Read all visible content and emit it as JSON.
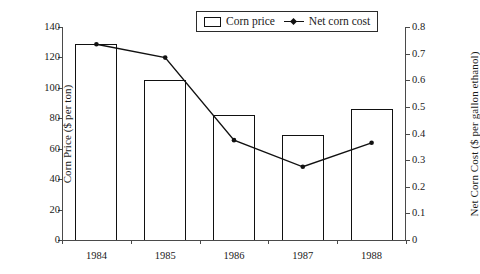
{
  "legend": {
    "entries": [
      {
        "label": "Corn price",
        "marker": "bar-swatch-icon"
      },
      {
        "label": "Net corn cost",
        "marker": "line-marker-icon"
      }
    ]
  },
  "axes": {
    "left_title": "Corn Price ($ per ton)",
    "right_title": "Net Corn Cost ($ per gallon ethanol)",
    "left_ticks": [
      "0",
      "20",
      "40",
      "60",
      "80",
      "100",
      "120",
      "140"
    ],
    "right_ticks": [
      "0",
      "0.1",
      "0.2",
      "0.3",
      "0.4",
      "0.5",
      "0.6",
      "0.7",
      "0.8"
    ],
    "x_ticks": [
      "1984",
      "1985",
      "1986",
      "1987",
      "1988"
    ]
  },
  "chart_data": {
    "type": "bar",
    "title": "",
    "xlabel": "",
    "ylabel": "Corn Price ($ per ton)",
    "y2label": "Net Corn Cost ($ per gallon ethanol)",
    "categories": [
      "1984",
      "1985",
      "1986",
      "1987",
      "1988"
    ],
    "grid": false,
    "legend_position": "top-center",
    "ylim": [
      0,
      140
    ],
    "y2lim": [
      0,
      0.8
    ],
    "ytick_step": 20,
    "y2tick_step": 0.1,
    "series": [
      {
        "name": "Corn price",
        "type": "bar",
        "axis": "left",
        "unit": "$ per ton",
        "values": [
          129,
          105,
          82,
          69,
          86
        ]
      },
      {
        "name": "Net corn cost",
        "type": "line",
        "axis": "right",
        "unit": "$ per gallon ethanol",
        "values": [
          0.735,
          0.685,
          0.375,
          0.275,
          0.365
        ]
      }
    ]
  }
}
